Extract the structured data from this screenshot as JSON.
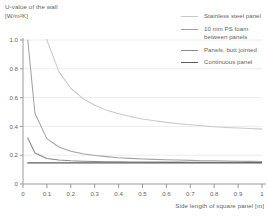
{
  "chart_data": {
    "type": "line",
    "title": "",
    "ylabel": "U-value of the wall\n[W/m²K]",
    "xlabel": "Side length of square panel [m]",
    "xlim": [
      0,
      1
    ],
    "ylim": [
      0,
      1
    ],
    "grid": "horizontal",
    "legend_position": "top-right",
    "xticks": [
      "0",
      "0.1",
      "0.2",
      "0.3",
      "0.4",
      "0.5",
      "0.6",
      "0.7",
      "0.8",
      "0.9",
      "1"
    ],
    "xtick_values": [
      0,
      0.1,
      0.2,
      0.3,
      0.4,
      0.5,
      0.6,
      0.7,
      0.8,
      0.9,
      1
    ],
    "yticks": [
      "0",
      "0.2",
      "0.4",
      "0.6",
      "0.8",
      "1.0"
    ],
    "ytick_values": [
      0,
      0.2,
      0.4,
      0.6,
      0.8,
      1.0
    ],
    "x": [
      0.02,
      0.05,
      0.1,
      0.15,
      0.2,
      0.25,
      0.3,
      0.35,
      0.4,
      0.45,
      0.5,
      0.55,
      0.6,
      0.65,
      0.7,
      0.75,
      0.8,
      0.85,
      0.9,
      0.95,
      1.0
    ],
    "series": [
      {
        "name": "Stainless steel panel",
        "color": "#c9c9c9",
        "values": [
          5.05,
          2.09,
          1.0,
          0.78,
          0.665,
          0.594,
          0.547,
          0.513,
          0.488,
          0.468,
          0.452,
          0.439,
          0.428,
          0.419,
          0.411,
          0.404,
          0.398,
          0.393,
          0.389,
          0.385,
          0.381
        ]
      },
      {
        "name": "10 mm PS foam\nbetween panels",
        "color": "#a3a3a3",
        "values": [
          1.0,
          0.49,
          0.315,
          0.257,
          0.228,
          0.21,
          0.198,
          0.19,
          0.183,
          0.178,
          0.174,
          0.171,
          0.168,
          0.166,
          0.164,
          0.162,
          0.161,
          0.159,
          0.158,
          0.157,
          0.156
        ]
      },
      {
        "name": "Panels, butt jointed",
        "color": "#8a8a8a",
        "values": [
          0.32,
          0.215,
          0.177,
          0.166,
          0.161,
          0.158,
          0.156,
          0.155,
          0.154,
          0.153,
          0.153,
          0.152,
          0.152,
          0.152,
          0.151,
          0.151,
          0.151,
          0.151,
          0.151,
          0.15,
          0.15
        ]
      },
      {
        "name": "Continuous panel",
        "color": "#5d5d5d",
        "values": [
          0.146,
          0.146,
          0.146,
          0.146,
          0.146,
          0.146,
          0.146,
          0.146,
          0.146,
          0.146,
          0.146,
          0.146,
          0.146,
          0.146,
          0.146,
          0.146,
          0.146,
          0.146,
          0.146,
          0.146,
          0.146
        ]
      }
    ]
  },
  "legend": {
    "entries": [
      {
        "label": "Stainless steel panel"
      },
      {
        "label": "10 mm PS foam\nbetween panels"
      },
      {
        "label": "Panels, butt jointed"
      },
      {
        "label": "Continuous panel"
      }
    ]
  },
  "colors": {
    "axis": "#9a9a9a",
    "grid": "#ececec",
    "text": "#5f5f5f"
  }
}
